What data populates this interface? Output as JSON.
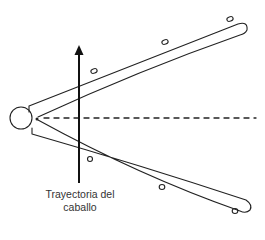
{
  "diagram": {
    "label_line1": "Trayectoria del",
    "label_line2": "caballo",
    "colors": {
      "stroke": "#222222",
      "background": "#ffffff"
    },
    "elements": {
      "vertex_circle": "circle at apex of V",
      "upper_arm": "upper rope/arm of V",
      "lower_arm": "lower rope/arm of V",
      "bisector": "dashed horizontal line",
      "trajectory_arrow": "vertical upward arrow",
      "markers_upper": 3,
      "markers_lower": 3
    }
  }
}
